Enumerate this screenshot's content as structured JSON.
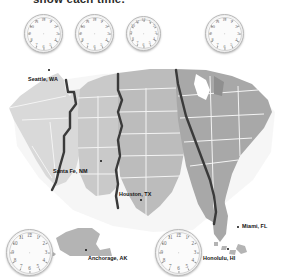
{
  "heading": {
    "text": "show each time."
  },
  "clocks": {
    "numerals": [
      "12",
      "1",
      "2",
      "3",
      "4",
      "5",
      "6",
      "7",
      "8",
      "9",
      "10",
      "11"
    ],
    "items": [
      {
        "name": "clock-pacific",
        "label": "blank clock face",
        "x": 24,
        "y": 14,
        "size": 37
      },
      {
        "name": "clock-mountain",
        "label": "blank clock face",
        "x": 75,
        "y": 14,
        "size": 37
      },
      {
        "name": "clock-central",
        "label": "blank clock face",
        "x": 126,
        "y": 16,
        "size": 33
      },
      {
        "name": "clock-eastern",
        "label": "blank clock face",
        "x": 205,
        "y": 14,
        "size": 37
      },
      {
        "name": "clock-alaska",
        "label": "blank clock face",
        "x": 6,
        "y": 229,
        "size": 45
      },
      {
        "name": "clock-hawaii",
        "label": "blank clock face",
        "x": 155,
        "y": 229,
        "size": 45
      }
    ]
  },
  "map": {
    "title": "United States time zone map",
    "zones": [
      {
        "name": "pacific",
        "fill": "#d9d9d9"
      },
      {
        "name": "mountain",
        "fill": "#c9c9c9"
      },
      {
        "name": "central",
        "fill": "#bcbcbc"
      },
      {
        "name": "eastern",
        "fill": "#a8a8a8"
      },
      {
        "name": "alaska",
        "fill": "#b4b4b4"
      },
      {
        "name": "hawaii",
        "fill": "#b4b4b4"
      }
    ],
    "boundary_color": "#3a3a3a",
    "state_line_color": "#f4f4f4",
    "cities": [
      {
        "name": "seattle",
        "label": "Seattle, WA",
        "label_x": 28,
        "label_y": 76,
        "dot_x": 48,
        "dot_y": 69
      },
      {
        "name": "santa-fe",
        "label": "Santa Fe, NM",
        "label_x": 53,
        "label_y": 168,
        "dot_x": 100,
        "dot_y": 160
      },
      {
        "name": "houston",
        "label": "Houston, TX",
        "label_x": 119,
        "label_y": 191,
        "dot_x": 140,
        "dot_y": 199
      },
      {
        "name": "miami",
        "label": "Miami, FL",
        "label_x": 242,
        "label_y": 224,
        "dot_x": 237,
        "dot_y": 226
      },
      {
        "name": "anchorage",
        "label": "Anchorage, AK",
        "label_x": 88,
        "label_y": 256,
        "dot_x": 85,
        "dot_y": 249
      },
      {
        "name": "honolulu",
        "label": "Honolulu, HI",
        "label_x": 203,
        "label_y": 256,
        "dot_x": 227,
        "dot_y": 248
      }
    ]
  }
}
